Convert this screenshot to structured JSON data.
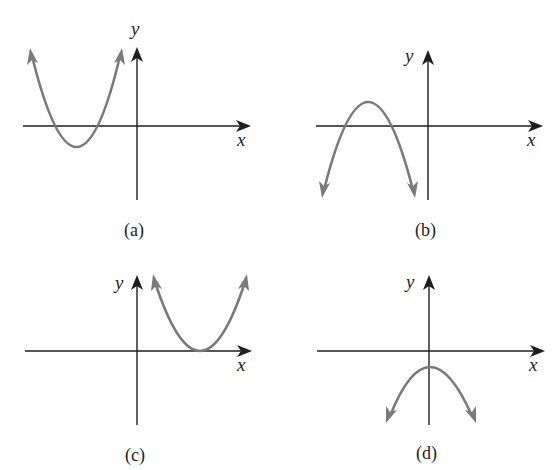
{
  "figure": {
    "top_cut_text": "",
    "panels": [
      {
        "id": "a",
        "caption": "(a)",
        "x_label": "x",
        "y_label": "y",
        "description": "Upward-opening parabola with vertex below x-axis, left of y-axis; two negative x-intercepts"
      },
      {
        "id": "b",
        "caption": "(b)",
        "x_label": "x",
        "y_label": "y",
        "description": "Downward-opening parabola with vertex above x-axis, left of y-axis; two negative x-intercepts"
      },
      {
        "id": "c",
        "caption": "(c)",
        "x_label": "x",
        "y_label": "y",
        "description": "Upward-opening parabola with vertex on positive x-axis; one repeated root"
      },
      {
        "id": "d",
        "caption": "(d)",
        "x_label": "x",
        "y_label": "y",
        "description": "Downward-opening parabola with vertex on y-axis below origin; no x-intercepts"
      }
    ]
  },
  "colors": {
    "axis": "#1e1e1e",
    "curve": "#7a7a7a",
    "background": "#ffffff"
  }
}
